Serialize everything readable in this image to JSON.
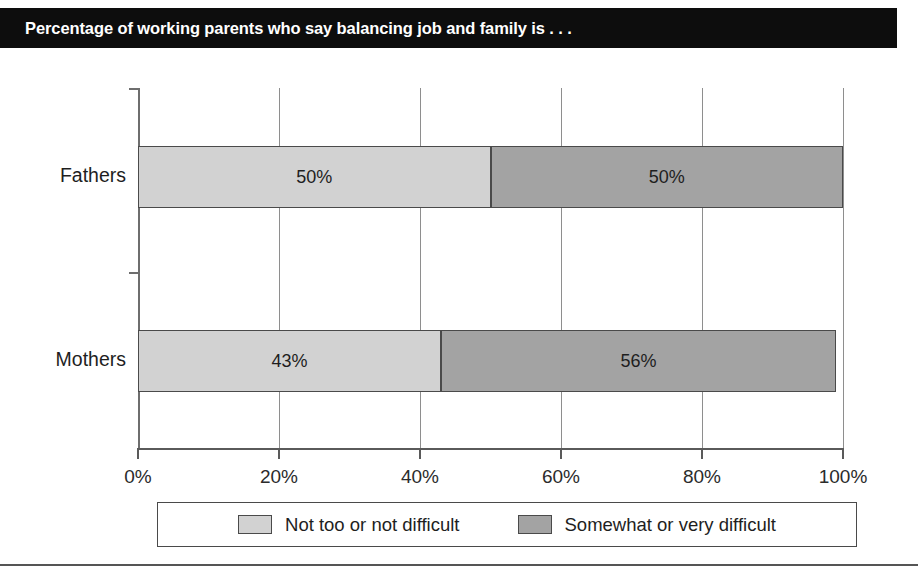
{
  "title": "Percentage of working parents who say balancing job and family is . . .",
  "colors": {
    "banner_bg": "#0d0d0d",
    "banner_text": "#ffffff",
    "series_light": "#d2d2d2",
    "series_dark": "#a3a3a3",
    "border": "#4a4a4a",
    "axis": "#5a5a5a",
    "gridline": "#8e8e8e",
    "rule": "#555555"
  },
  "legend": {
    "items": [
      {
        "label": "Not too or not difficult",
        "swatch": "#d2d2d2"
      },
      {
        "label": "Somewhat or very difficult",
        "swatch": "#a3a3a3"
      }
    ]
  },
  "axis": {
    "x_tick_labels": [
      "0%",
      "20%",
      "40%",
      "60%",
      "80%",
      "100%"
    ]
  },
  "chart_data": {
    "type": "bar",
    "orientation": "horizontal",
    "stacked": true,
    "title": "Percentage of working parents who say balancing job and family is . . .",
    "xlabel": "",
    "ylabel": "",
    "xlim": [
      0,
      100
    ],
    "xticks": [
      0,
      20,
      40,
      60,
      80,
      100
    ],
    "xtick_labels": [
      "0%",
      "20%",
      "40%",
      "60%",
      "80%",
      "100%"
    ],
    "grid": true,
    "legend_position": "bottom",
    "categories": [
      "Fathers",
      "Mothers"
    ],
    "series": [
      {
        "name": "Not too or not difficult",
        "color": "#d2d2d2",
        "values": [
          50,
          43
        ],
        "labels": [
          "50%",
          "43%"
        ]
      },
      {
        "name": "Somewhat or very difficult",
        "color": "#a3a3a3",
        "values": [
          50,
          56
        ],
        "labels": [
          "50%",
          "56%"
        ]
      }
    ],
    "bars": [
      {
        "category": "Fathers",
        "segments": [
          {
            "series": "Not too or not difficult",
            "value": 50,
            "label": "50%",
            "start": 0,
            "end": 50
          },
          {
            "series": "Somewhat or very difficult",
            "value": 50,
            "label": "50%",
            "start": 50,
            "end": 100
          }
        ],
        "total": 100
      },
      {
        "category": "Mothers",
        "segments": [
          {
            "series": "Not too or not difficult",
            "value": 43,
            "label": "43%",
            "start": 0,
            "end": 43
          },
          {
            "series": "Somewhat or very difficult",
            "value": 56,
            "label": "56%",
            "start": 43,
            "end": 99
          }
        ],
        "total": 99
      }
    ]
  }
}
